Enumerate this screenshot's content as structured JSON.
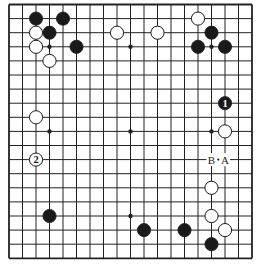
{
  "board": {
    "size": 19,
    "origin_x": 9,
    "origin_y": 4.5,
    "step_x": 13.5,
    "step_y": 14.1,
    "stone_radius": 6.6,
    "line_color": "#222222",
    "black_color": "#1a1a1a",
    "white_color": "#ffffff"
  },
  "star_points": [
    [
      3,
      3
    ],
    [
      9,
      3
    ],
    [
      15,
      3
    ],
    [
      3,
      9
    ],
    [
      9,
      9
    ],
    [
      15,
      9
    ],
    [
      3,
      15
    ],
    [
      9,
      15
    ],
    [
      15,
      15
    ]
  ],
  "stones": [
    {
      "color": "black",
      "col": 2,
      "row": 1
    },
    {
      "color": "black",
      "col": 4,
      "row": 1
    },
    {
      "color": "white",
      "col": 2,
      "row": 2
    },
    {
      "color": "black",
      "col": 3,
      "row": 2
    },
    {
      "color": "white",
      "col": 2,
      "row": 3
    },
    {
      "color": "black",
      "col": 5,
      "row": 3
    },
    {
      "color": "white",
      "col": 3,
      "row": 4
    },
    {
      "color": "white",
      "col": 8,
      "row": 2
    },
    {
      "color": "white",
      "col": 11,
      "row": 2
    },
    {
      "color": "white",
      "col": 14,
      "row": 1
    },
    {
      "color": "black",
      "col": 15,
      "row": 2
    },
    {
      "color": "black",
      "col": 14,
      "row": 3
    },
    {
      "color": "black",
      "col": 16,
      "row": 3
    },
    {
      "color": "white",
      "col": 2,
      "row": 8
    },
    {
      "color": "black",
      "col": 16,
      "row": 7,
      "label": "1"
    },
    {
      "color": "white",
      "col": 16,
      "row": 9
    },
    {
      "color": "white",
      "col": 2,
      "row": 11,
      "label": "2"
    },
    {
      "color": "white",
      "col": 15,
      "row": 13
    },
    {
      "color": "white",
      "col": 15,
      "row": 15
    },
    {
      "color": "white",
      "col": 16,
      "row": 16
    },
    {
      "color": "black",
      "col": 3,
      "row": 15
    },
    {
      "color": "black",
      "col": 10,
      "row": 16
    },
    {
      "color": "black",
      "col": 13,
      "row": 16
    },
    {
      "color": "black",
      "col": 15,
      "row": 17
    }
  ],
  "point_labels": [
    {
      "text": "B",
      "col": 15,
      "row": 11
    },
    {
      "text": "A",
      "col": 16,
      "row": 11
    }
  ],
  "separator_dot": {
    "text": "·",
    "between": [
      "B",
      "A"
    ]
  }
}
